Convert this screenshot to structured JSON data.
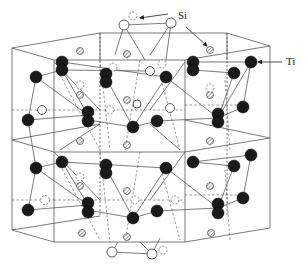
{
  "figure": {
    "labels": {
      "si": "Si",
      "ti": "Ti"
    },
    "legend": [
      {
        "symbol": "filled-black-circle",
        "element": "Ti"
      },
      {
        "symbol": "open-or-hatched-circle",
        "element": "Si"
      }
    ],
    "colors": {
      "ti_atom": "#1a1a1a",
      "si_atom": "#ffffff",
      "lines": "#555555"
    }
  }
}
